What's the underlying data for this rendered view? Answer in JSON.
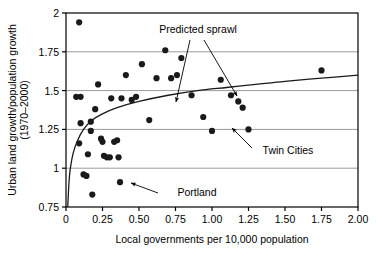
{
  "chart_data": {
    "type": "scatter",
    "title": "",
    "xlabel": "Local governments per 10,000 population",
    "ylabel": "Urban land growth/population growth (1970–2000)",
    "xlim": [
      0,
      2.0
    ],
    "ylim": [
      0.75,
      2.0
    ],
    "xticks": [
      "0",
      "0.25",
      "0.50",
      "0.75",
      "1.00",
      "1.25",
      "1.50",
      "1.75",
      "2.00"
    ],
    "xtick_values": [
      0,
      0.25,
      0.5,
      0.75,
      1.0,
      1.25,
      1.5,
      1.75,
      2.0
    ],
    "yticks": [
      "0.75",
      "1",
      "1.25",
      "1.5",
      "1.75",
      "2"
    ],
    "ytick_values": [
      0.75,
      1.0,
      1.25,
      1.5,
      1.75,
      2.0
    ],
    "grid": "horizontal",
    "legend": "none",
    "series": [
      {
        "name": "Metropolitan areas",
        "marker": "filled-circle",
        "color": "#1a1a1a",
        "points": [
          [
            0.09,
            1.94
          ],
          [
            0.07,
            1.46
          ],
          [
            0.1,
            1.46
          ],
          [
            0.1,
            1.29
          ],
          [
            0.09,
            1.16
          ],
          [
            0.12,
            0.96
          ],
          [
            0.14,
            0.95
          ],
          [
            0.15,
            1.09
          ],
          [
            0.17,
            1.24
          ],
          [
            0.17,
            1.3
          ],
          [
            0.18,
            0.83
          ],
          [
            0.2,
            1.38
          ],
          [
            0.22,
            1.54
          ],
          [
            0.24,
            1.19
          ],
          [
            0.25,
            1.17
          ],
          [
            0.26,
            1.08
          ],
          [
            0.28,
            1.07
          ],
          [
            0.3,
            1.07
          ],
          [
            0.31,
            1.45
          ],
          [
            0.33,
            1.17
          ],
          [
            0.35,
            1.18
          ],
          [
            0.36,
            1.07
          ],
          [
            0.37,
            0.91
          ],
          [
            0.38,
            1.45
          ],
          [
            0.41,
            1.6
          ],
          [
            0.45,
            1.44
          ],
          [
            0.48,
            1.46
          ],
          [
            0.52,
            1.67
          ],
          [
            0.57,
            1.31
          ],
          [
            0.62,
            1.58
          ],
          [
            0.68,
            1.76
          ],
          [
            0.72,
            1.58
          ],
          [
            0.76,
            1.6
          ],
          [
            0.79,
            1.71
          ],
          [
            0.86,
            1.47
          ],
          [
            0.94,
            1.33
          ],
          [
            1.0,
            1.24
          ],
          [
            1.06,
            1.57
          ],
          [
            1.13,
            1.47
          ],
          [
            1.18,
            1.43
          ],
          [
            1.21,
            1.39
          ],
          [
            1.25,
            1.25
          ],
          [
            1.75,
            1.63
          ]
        ]
      }
    ],
    "fit_curve": {
      "name": "Predicted sprawl",
      "type": "logarithmic",
      "color": "#1a1a1a",
      "points": [
        [
          0.012,
          0.75
        ],
        [
          0.02,
          0.9
        ],
        [
          0.03,
          1.0
        ],
        [
          0.05,
          1.1
        ],
        [
          0.08,
          1.18
        ],
        [
          0.12,
          1.25
        ],
        [
          0.18,
          1.31
        ],
        [
          0.25,
          1.35
        ],
        [
          0.35,
          1.39
        ],
        [
          0.5,
          1.43
        ],
        [
          0.7,
          1.47
        ],
        [
          0.9,
          1.5
        ],
        [
          1.1,
          1.52
        ],
        [
          1.3,
          1.54
        ],
        [
          1.5,
          1.56
        ],
        [
          1.75,
          1.58
        ],
        [
          2.0,
          1.6
        ]
      ]
    },
    "annotations": [
      {
        "label": "Predicted sprawl",
        "text_x": 198,
        "text_y": 33,
        "arrows": [
          {
            "x1": 190,
            "y1": 40,
            "x2": 176,
            "y2": 102
          },
          {
            "x1": 204,
            "y1": 40,
            "x2": 237,
            "y2": 96
          }
        ]
      },
      {
        "label": "Twin Cities",
        "text_x": 288,
        "text_y": 154,
        "arrows": [
          {
            "x1": 252,
            "y1": 148,
            "x2": 232,
            "y2": 128
          }
        ]
      },
      {
        "label": "Portland",
        "text_x": 197,
        "text_y": 196,
        "arrows": [
          {
            "x1": 158,
            "y1": 193,
            "x2": 131,
            "y2": 183
          }
        ]
      }
    ]
  },
  "plot": {
    "frame": {
      "left": 66,
      "top": 13,
      "right": 358,
      "bottom": 207
    },
    "colors": {
      "axis": "#000000",
      "grid": "#9a9a9a",
      "marker": "#1a1a1a",
      "curve": "#1a1a1a",
      "background": "#ffffff"
    }
  }
}
